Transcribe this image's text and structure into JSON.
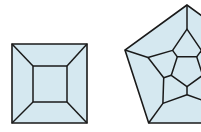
{
  "diagram": {
    "colors": {
      "fill": "#d5e8f0",
      "stroke": "#1a1a1a",
      "background": "#ffffff"
    },
    "figures": [
      {
        "name": "cube-schlegel",
        "outer_square": [
          [
            12,
            44
          ],
          [
            87,
            44
          ],
          [
            87,
            123
          ],
          [
            12,
            123
          ]
        ],
        "inner_square": [
          [
            33,
            66
          ],
          [
            67,
            66
          ],
          [
            67,
            102
          ],
          [
            33,
            102
          ]
        ]
      },
      {
        "name": "dodecahedron-schlegel",
        "center": [
          187,
          70.2
        ],
        "outer_radius": 65.2,
        "spoke_radius": 41,
        "middle_radius": 24.5,
        "inner_radius": 16.5,
        "clipped_right_edge": 201
      }
    ]
  }
}
